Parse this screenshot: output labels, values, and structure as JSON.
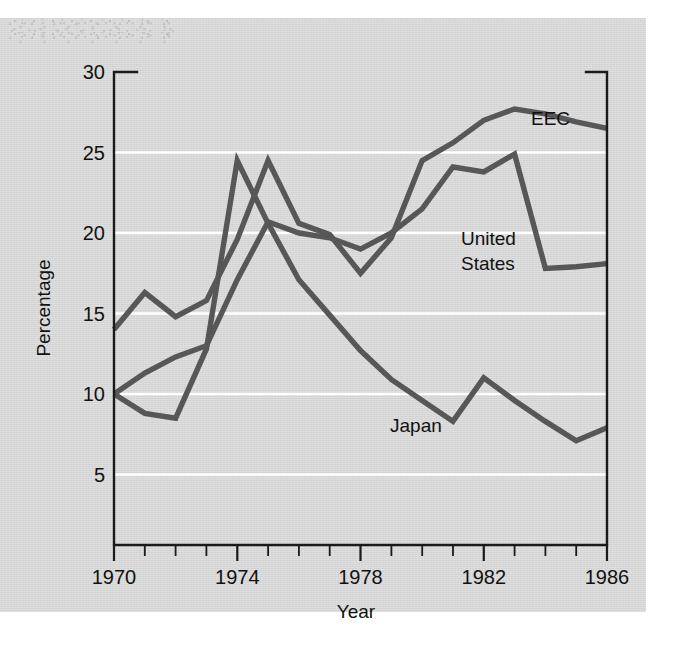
{
  "chart_data": {
    "type": "line",
    "title": "",
    "xlabel": "Year",
    "ylabel": "Percentage",
    "xlim": [
      1970,
      1986
    ],
    "ylim": [
      1.5,
      30
    ],
    "grid": "horizontal-white-gridlines",
    "legend": "inline-labels-at-series-end",
    "x": [
      1970,
      1971,
      1972,
      1973,
      1974,
      1975,
      1976,
      1977,
      1978,
      1979,
      1980,
      1981,
      1982,
      1983,
      1984,
      1985,
      1986
    ],
    "y_ticks": [
      5,
      10,
      15,
      20,
      25,
      30
    ],
    "y_tick_labels": [
      "5",
      "10",
      "15",
      "20",
      "25",
      "30"
    ],
    "x_ticks": [
      1970,
      1971,
      1972,
      1973,
      1974,
      1975,
      1976,
      1977,
      1978,
      1979,
      1980,
      1981,
      1982,
      1983,
      1984,
      1985,
      1986
    ],
    "x_major_ticks": [
      1970,
      1974,
      1978,
      1982,
      1986
    ],
    "x_tick_labels": [
      "1970",
      "1974",
      "1978",
      "1982",
      "1986"
    ],
    "series": [
      {
        "name": "EEC",
        "label": "EEC",
        "color": "#575757",
        "values": [
          14.0,
          16.3,
          14.8,
          15.8,
          19.6,
          24.5,
          20.6,
          19.9,
          17.5,
          19.7,
          24.5,
          25.6,
          27.0,
          27.7,
          27.4,
          26.9,
          26.5
        ]
      },
      {
        "name": "United States",
        "label": "United States",
        "color": "#575757",
        "values": [
          10.0,
          11.3,
          12.3,
          13.0,
          17.1,
          20.7,
          20.0,
          19.7,
          19.0,
          20.0,
          21.5,
          24.1,
          23.8,
          24.9,
          17.8,
          17.9,
          18.1
        ]
      },
      {
        "name": "Japan",
        "label": "Japan",
        "color": "#575757",
        "values": [
          10.0,
          8.8,
          8.5,
          12.8,
          24.5,
          20.6,
          17.1,
          14.9,
          12.7,
          10.9,
          9.6,
          8.3,
          11.0,
          9.6,
          8.3,
          7.1,
          7.9
        ]
      }
    ],
    "notes": {
      "background_color": "#d8d8d8",
      "gridline_color": "#ffffff",
      "axis_color": "#1a1a1a",
      "line_color": "#575757"
    }
  },
  "labels": {
    "y_axis_title": "Percentage",
    "x_axis_title": "Year",
    "series_eec": "EEC",
    "series_us_line1": "United",
    "series_us_line2": "States",
    "series_japan": "Japan",
    "y0": "30",
    "y1": "25",
    "y2": "20",
    "y3": "15",
    "y4": "10",
    "y5": "5",
    "x0": "1970",
    "x1": "1974",
    "x2": "1978",
    "x3": "1982",
    "x4": "1986"
  }
}
